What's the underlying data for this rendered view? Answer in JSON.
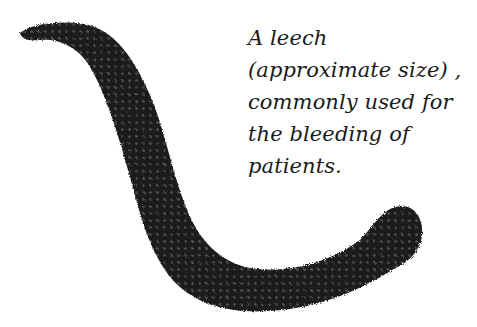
{
  "figure": {
    "colors": {
      "body": "#1c1c1c",
      "segment": "#5a5a5a",
      "background": "#ffffff"
    }
  },
  "caption": {
    "lines": [
      "A leech",
      "(approximate size) ,",
      "commonly used for",
      "the bleeding of",
      "patients."
    ]
  }
}
